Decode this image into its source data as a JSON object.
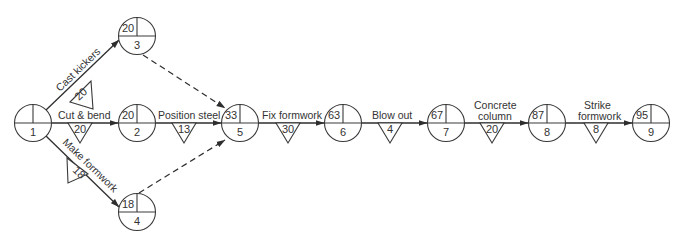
{
  "diagram": {
    "type": "activity-on-arrow network",
    "nodes": [
      {
        "id": "1",
        "event": "1",
        "earliest": "",
        "x": 33,
        "y": 123
      },
      {
        "id": "2",
        "event": "2",
        "earliest": "20",
        "x": 137,
        "y": 123
      },
      {
        "id": "3",
        "event": "3",
        "earliest": "20",
        "x": 137,
        "y": 36
      },
      {
        "id": "4",
        "event": "4",
        "earliest": "18",
        "x": 137,
        "y": 212
      },
      {
        "id": "5",
        "event": "5",
        "earliest": "33",
        "x": 240,
        "y": 123
      },
      {
        "id": "6",
        "event": "6",
        "earliest": "63",
        "x": 343,
        "y": 123
      },
      {
        "id": "7",
        "event": "7",
        "earliest": "67",
        "x": 446,
        "y": 123
      },
      {
        "id": "8",
        "event": "8",
        "earliest": "87",
        "x": 547,
        "y": 123
      },
      {
        "id": "9",
        "event": "9",
        "earliest": "95",
        "x": 651,
        "y": 123
      }
    ],
    "activities": [
      {
        "from": "1",
        "to": "3",
        "label": "Cast kickers",
        "duration": "20"
      },
      {
        "from": "1",
        "to": "2",
        "label": "Cut & bend",
        "duration": "20"
      },
      {
        "from": "1",
        "to": "4",
        "label": "Make formwork",
        "duration": "18"
      },
      {
        "from": "2",
        "to": "5",
        "label": "Position steel",
        "duration": "13"
      },
      {
        "from": "5",
        "to": "6",
        "label": "Fix formwork",
        "duration": "30"
      },
      {
        "from": "6",
        "to": "7",
        "label": "Blow out",
        "duration": "4"
      },
      {
        "from": "7",
        "to": "8",
        "label_line1": "Concrete",
        "label_line2": "column",
        "duration": "20"
      },
      {
        "from": "8",
        "to": "9",
        "label_line1": "Strike",
        "label_line2": "formwork",
        "duration": "8"
      }
    ],
    "dummies": [
      {
        "from": "3",
        "to": "5"
      },
      {
        "from": "4",
        "to": "5"
      }
    ],
    "colors": {
      "line": "#2e2e2e",
      "text": "#333333",
      "background": "#ffffff"
    }
  }
}
